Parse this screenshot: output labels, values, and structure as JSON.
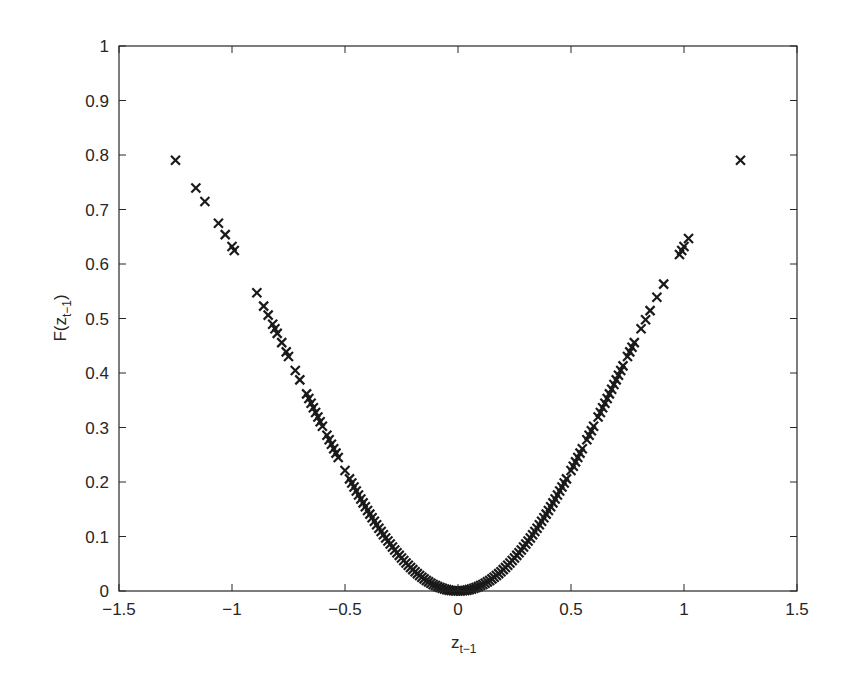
{
  "chart_data": {
    "type": "scatter",
    "title": "",
    "xlabel": "z_{t-1}",
    "ylabel": "F(z_{t-1})",
    "xlabel_main": "z",
    "xlabel_sub": "t−1",
    "ylabel_prefix": "F(z",
    "ylabel_sub": "t−1",
    "ylabel_suffix": ")",
    "xlim": [
      -1.5,
      1.5
    ],
    "ylim": [
      0,
      1
    ],
    "xticks": [
      -1.5,
      -1,
      -0.5,
      0,
      0.5,
      1,
      1.5
    ],
    "xtick_labels": [
      "−1.5",
      "−1",
      "−0.5",
      "0",
      "0.5",
      "1",
      "1.5"
    ],
    "yticks": [
      0,
      0.1,
      0.2,
      0.3,
      0.4,
      0.5,
      0.6,
      0.7,
      0.8,
      0.9,
      1
    ],
    "ytick_labels": [
      "0",
      "0.1",
      "0.2",
      "0.3",
      "0.4",
      "0.5",
      "0.6",
      "0.7",
      "0.8",
      "0.9",
      "1"
    ],
    "grid": false,
    "legend": null,
    "marker": "x",
    "marker_color": "#1a1a1a",
    "series": [
      {
        "name": "F(z_{t-1})",
        "x": [
          -1.25,
          -1.16,
          -1.12,
          -1.06,
          -1.03,
          -1.0,
          -0.99,
          -0.89,
          -0.86,
          -0.84,
          -0.82,
          -0.81,
          -0.8,
          -0.78,
          -0.76,
          -0.75,
          -0.72,
          -0.7,
          -0.67,
          -0.66,
          -0.65,
          -0.64,
          -0.63,
          -0.62,
          -0.61,
          -0.6,
          -0.58,
          -0.57,
          -0.56,
          -0.55,
          -0.54,
          -0.53,
          -0.5,
          -0.48,
          -0.47,
          -0.46,
          -0.45,
          -0.44,
          -0.43,
          -0.42,
          -0.41,
          -0.4,
          -0.39,
          -0.38,
          -0.37,
          -0.36,
          -0.35,
          -0.34,
          -0.33,
          -0.32,
          -0.31,
          -0.3,
          -0.29,
          -0.28,
          -0.27,
          -0.26,
          -0.25,
          -0.24,
          -0.23,
          -0.22,
          -0.21,
          -0.2,
          -0.19,
          -0.18,
          -0.17,
          -0.16,
          -0.15,
          -0.14,
          -0.13,
          -0.12,
          -0.11,
          -0.1,
          -0.09,
          -0.08,
          -0.07,
          -0.06,
          -0.05,
          -0.04,
          -0.03,
          -0.02,
          -0.01,
          0.0,
          0.01,
          0.02,
          0.03,
          0.04,
          0.05,
          0.06,
          0.07,
          0.08,
          0.09,
          0.1,
          0.11,
          0.12,
          0.13,
          0.14,
          0.15,
          0.16,
          0.17,
          0.18,
          0.19,
          0.2,
          0.21,
          0.22,
          0.23,
          0.24,
          0.25,
          0.26,
          0.27,
          0.28,
          0.29,
          0.3,
          0.31,
          0.32,
          0.33,
          0.34,
          0.35,
          0.36,
          0.37,
          0.38,
          0.39,
          0.4,
          0.41,
          0.42,
          0.43,
          0.44,
          0.45,
          0.46,
          0.47,
          0.48,
          0.5,
          0.51,
          0.52,
          0.53,
          0.54,
          0.55,
          0.57,
          0.58,
          0.59,
          0.6,
          0.62,
          0.63,
          0.64,
          0.65,
          0.66,
          0.67,
          0.68,
          0.69,
          0.7,
          0.71,
          0.72,
          0.73,
          0.75,
          0.76,
          0.77,
          0.78,
          0.81,
          0.83,
          0.85,
          0.88,
          0.91,
          0.98,
          0.99,
          1.0,
          1.02,
          1.25
        ],
        "y_formula": "1 - exp(-x^2)"
      }
    ]
  }
}
